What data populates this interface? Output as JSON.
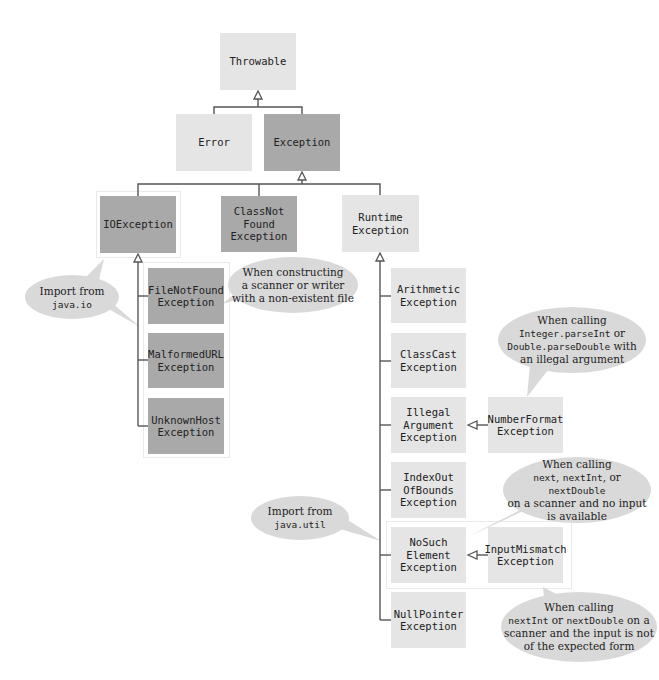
{
  "diagram": {
    "type": "class-hierarchy",
    "colors": {
      "unchecked_box": "#e5e5e5",
      "checked_box": "#a9a9a9",
      "callout": "#d9d9d9",
      "connector": "#555555"
    },
    "nodes": {
      "throwable": "Throwable",
      "error": "Error",
      "exception": "Exception",
      "ioexception": "IOException",
      "classnotfound": "ClassNot\nFound\nException",
      "runtime": "Runtime\nException",
      "filenotfound": "FileNotFound\nException",
      "malformedurl": "MalformedURL\nException",
      "unknownhost": "UnknownHost\nException",
      "arithmetic": "Arithmetic\nException",
      "classcast": "ClassCast\nException",
      "illegalargument": "Illegal\nArgument\nException",
      "numberformat": "NumberFormat\nException",
      "indexoutofbounds": "IndexOut\nOfBounds\nException",
      "nosuchelement": "NoSuch\nElement\nException",
      "inputmismatch": "InputMismatch\nException",
      "nullpointer": "NullPointer\nException"
    },
    "callouts": {
      "java_io": {
        "line1": "Import from",
        "code": "java.io"
      },
      "filenotfound_note": {
        "line1": "When constructing",
        "line2": "a scanner or writer",
        "line3": "with a non-existent file"
      },
      "numberformat_note": {
        "line1": "When calling",
        "code1": "Integer.parseInt",
        "text1": " or",
        "code2": "Double.parseDouble",
        "text2": " with",
        "line4": "an illegal argument"
      },
      "java_util": {
        "line1": "Import from",
        "code": "java.util"
      },
      "nosuchelement_note": {
        "line1": "When calling",
        "code1": "next",
        "sep1": ", ",
        "code2": "nextInt",
        "sep2": ", or ",
        "code3": "nextDouble",
        "line3": "on a scanner and no input",
        "line4": "is available"
      },
      "inputmismatch_note": {
        "line1": "When calling",
        "code1": "nextInt",
        "sep1": " or ",
        "code2": "nextDouble",
        "text2": " on a",
        "line3": "scanner and the input is not",
        "line4": "of the expected form"
      }
    }
  }
}
